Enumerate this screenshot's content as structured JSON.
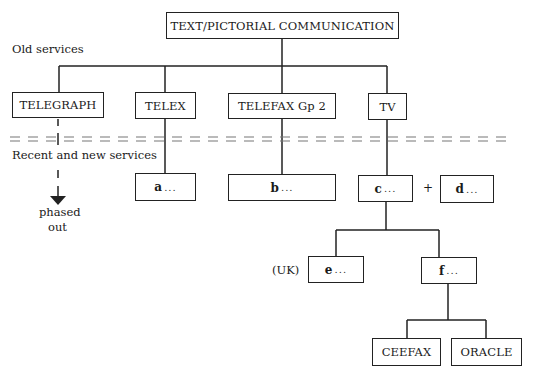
{
  "diagram": {
    "root": "TEXT/PICTORIAL COMMUNICATION",
    "section_labels": {
      "old": "Old services",
      "new": "Recent and new services"
    },
    "old_services": [
      {
        "id": "telegraph",
        "label": "TELEGRAPH"
      },
      {
        "id": "telex",
        "label": "TELEX"
      },
      {
        "id": "telefax",
        "label": "TELEFAX Gp 2"
      },
      {
        "id": "tv",
        "label": "TV"
      }
    ],
    "new_services": [
      {
        "id": "a",
        "letter": "a",
        "dots": "..."
      },
      {
        "id": "b",
        "letter": "b",
        "dots": "..."
      },
      {
        "id": "c",
        "letter": "c",
        "dots": "..."
      },
      {
        "id": "d",
        "letter": "d",
        "dots": "..."
      },
      {
        "id": "e",
        "letter": "e",
        "dots": "..."
      },
      {
        "id": "f",
        "letter": "f",
        "dots": "..."
      }
    ],
    "plus_sign": "+",
    "uk_note": "(UK)",
    "phased_out": {
      "line1": "phased",
      "line2": "out"
    },
    "teletext": [
      {
        "id": "ceefax",
        "label": "CEEFAX"
      },
      {
        "id": "oracle",
        "label": "ORACLE"
      }
    ]
  }
}
